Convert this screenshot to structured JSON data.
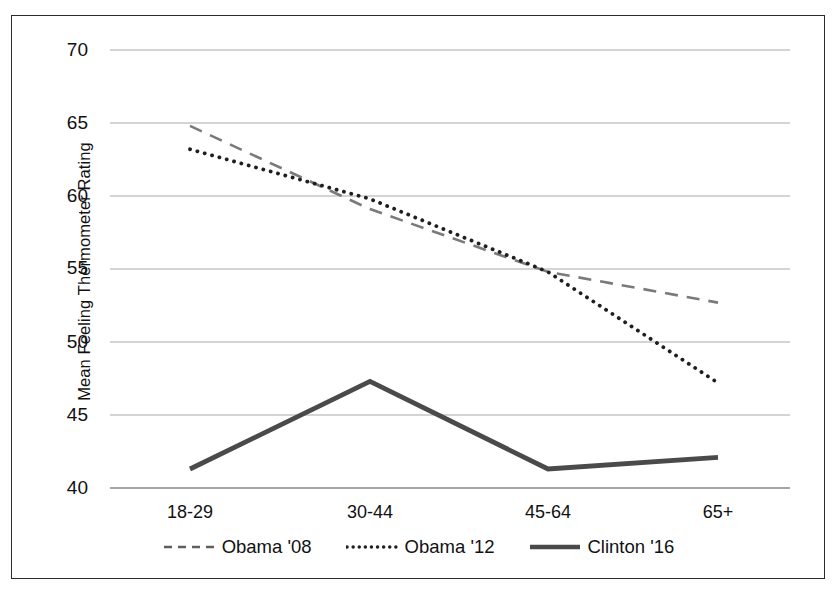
{
  "chart_data": {
    "type": "line",
    "title": "",
    "subtitle": "",
    "xlabel": "",
    "ylabel": "Mean Feeling Thermometer Rating",
    "categories": [
      "18-29",
      "30-44",
      "45-64",
      "65+"
    ],
    "ylim": [
      40,
      70
    ],
    "yticks": [
      40,
      45,
      50,
      55,
      60,
      65,
      70
    ],
    "ytick_labels": [
      "40",
      "45",
      "50",
      "55",
      "60",
      "65",
      "70"
    ],
    "grid": "horizontal",
    "legend_position": "bottom",
    "series": [
      {
        "name": "Obama '08",
        "values": [
          64.8,
          59.1,
          54.8,
          52.7
        ],
        "style": "dashed",
        "color": "#7a7a7a",
        "width": 2.6
      },
      {
        "name": "Obama '12",
        "values": [
          63.2,
          59.8,
          54.8,
          47.2
        ],
        "style": "dotted",
        "color": "#1f1f1f",
        "width": 3.6
      },
      {
        "name": "Clinton '16",
        "values": [
          41.3,
          47.3,
          41.3,
          42.1
        ],
        "style": "solid",
        "color": "#4a4a4a",
        "width": 4.6
      }
    ]
  },
  "axis": {
    "y_title": "Mean Feeling Thermometer Rating",
    "y_labels": {
      "t70": "70",
      "t65": "65",
      "t60": "60",
      "t55": "55",
      "t50": "50",
      "t45": "45",
      "t40": "40"
    },
    "x_labels": {
      "c0": "18-29",
      "c1": "30-44",
      "c2": "45-64",
      "c3": "65+"
    }
  },
  "legend": {
    "items": [
      {
        "label": "Obama '08",
        "style": "dashed",
        "color": "#7a7a7a"
      },
      {
        "label": "Obama '12",
        "style": "dotted",
        "color": "#1f1f1f"
      },
      {
        "label": "Clinton '16",
        "style": "solid",
        "color": "#4a4a4a"
      }
    ]
  },
  "colors": {
    "frame": "#2b2b2b",
    "gridline": "#a9a9a9",
    "axis_line": "#7d7d7d",
    "text": "#111111",
    "background": "#ffffff"
  }
}
